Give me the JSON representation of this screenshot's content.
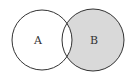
{
  "diagram": {
    "type": "venn",
    "shaded_region": "B \\ A",
    "colors": {
      "background": "#ffffff",
      "stroke": "#333333",
      "shade": "#d9d9d9",
      "unshaded": "#ffffff"
    },
    "sets": [
      {
        "id": "A",
        "label": "A",
        "cx": 42,
        "cy": 40,
        "r": 30,
        "shaded": false
      },
      {
        "id": "B",
        "label": "B",
        "cx": 93,
        "cy": 40,
        "r": 31,
        "shaded": true
      }
    ],
    "intersection": {
      "shaded": false
    }
  }
}
